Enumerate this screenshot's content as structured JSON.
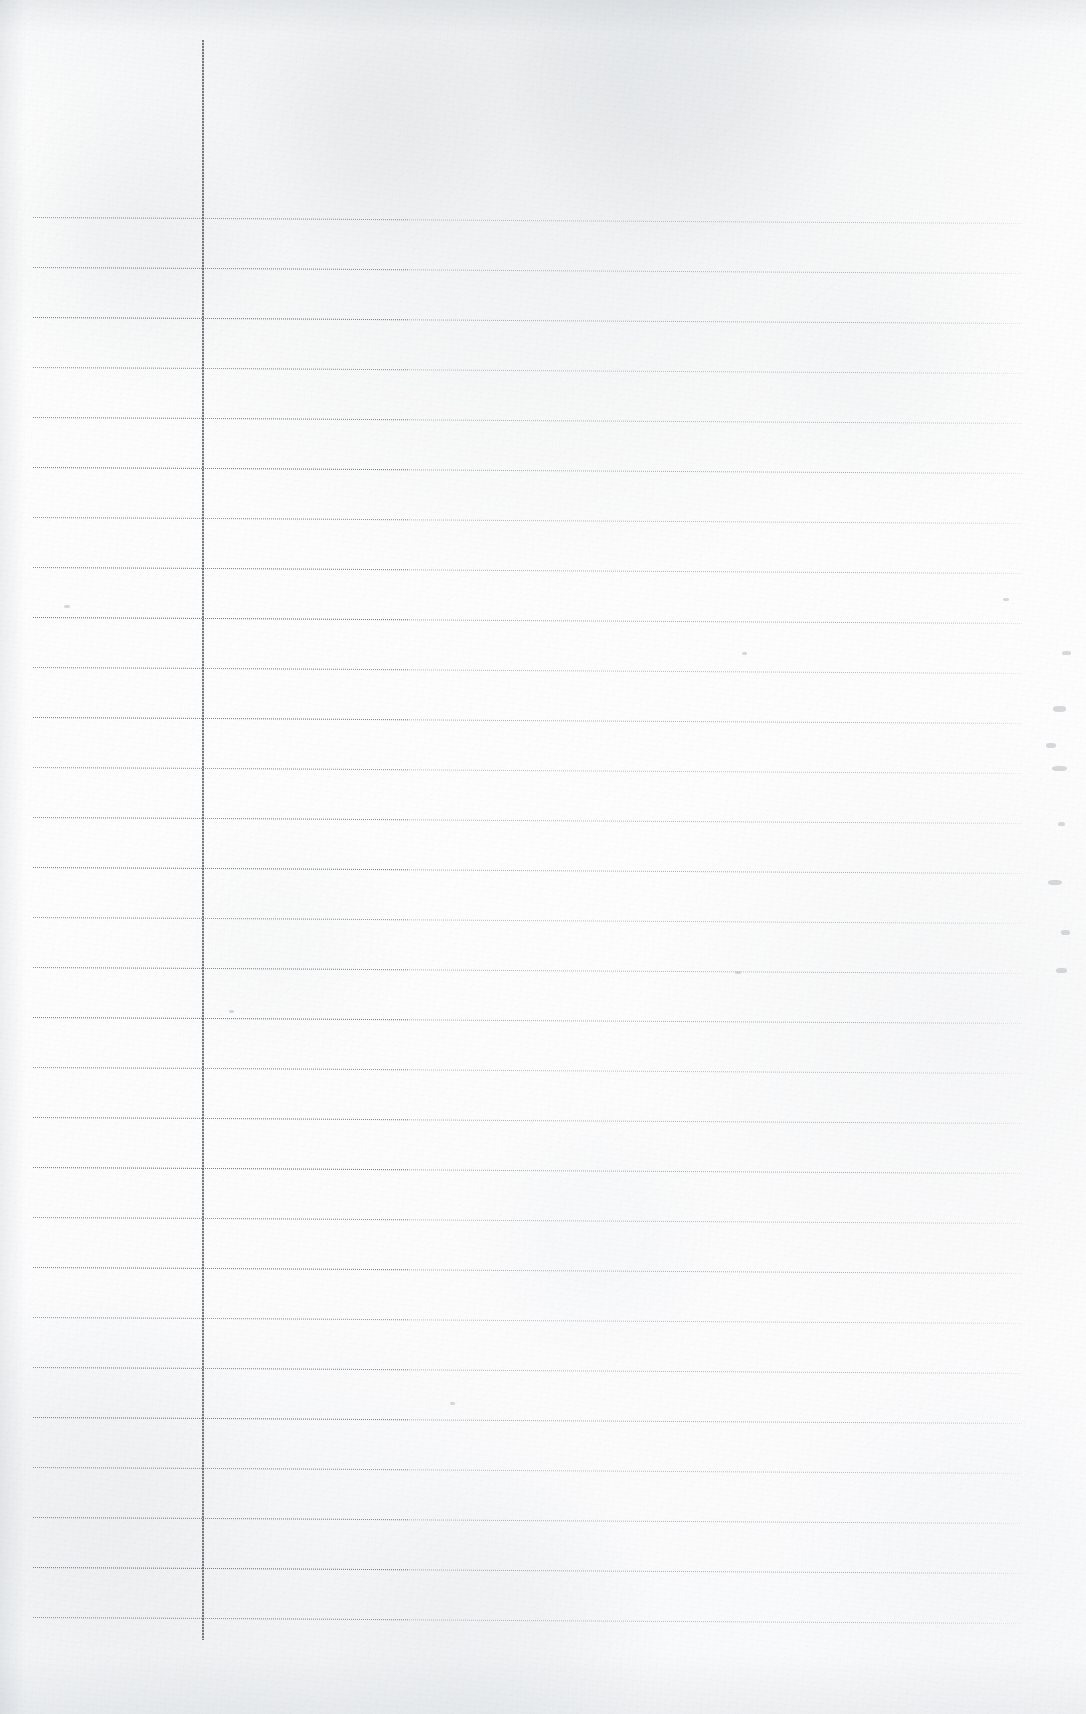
{
  "document": {
    "kind": "scanned-ruled-notebook-page",
    "title": "Blank ruled notebook page",
    "orientation": "portrait",
    "content_text": "",
    "is_blank": true,
    "width_px": 1086,
    "height_px": 1714
  },
  "paper": {
    "base_color": "#fbfbfb",
    "edge_shadow_color": "#e6e9ec",
    "texture": "fibrous scan grain"
  },
  "ruling": {
    "horizontal": {
      "color": "#767c84",
      "style": "dotted",
      "count": 29,
      "first_y": 217,
      "spacing_px": 50,
      "x_start": 33,
      "x_end": 1022,
      "slope_deg": 0.35
    },
    "vertical_margin": {
      "color": "#565c64",
      "style": "solid",
      "x": 202,
      "y_start": 40,
      "y_end": 1640,
      "width_px": 2
    }
  },
  "marks": {
    "label": "faint right-edge smudges",
    "items": [
      {
        "x": 1062,
        "y": 651,
        "w": 9,
        "h": 4
      },
      {
        "x": 1053,
        "y": 706,
        "w": 13,
        "h": 6
      },
      {
        "x": 1046,
        "y": 743,
        "w": 10,
        "h": 5
      },
      {
        "x": 1052,
        "y": 766,
        "w": 15,
        "h": 5
      },
      {
        "x": 1058,
        "y": 822,
        "w": 7,
        "h": 4
      },
      {
        "x": 1048,
        "y": 880,
        "w": 14,
        "h": 5
      },
      {
        "x": 1061,
        "y": 930,
        "w": 9,
        "h": 5
      },
      {
        "x": 1056,
        "y": 968,
        "w": 11,
        "h": 5
      },
      {
        "x": 1003,
        "y": 598,
        "w": 6,
        "h": 3
      },
      {
        "x": 742,
        "y": 652,
        "w": 5,
        "h": 3
      },
      {
        "x": 735,
        "y": 971,
        "w": 6,
        "h": 3
      },
      {
        "x": 229,
        "y": 1010,
        "w": 5,
        "h": 3
      },
      {
        "x": 64,
        "y": 605,
        "w": 6,
        "h": 3
      },
      {
        "x": 450,
        "y": 1402,
        "w": 5,
        "h": 3
      }
    ]
  }
}
